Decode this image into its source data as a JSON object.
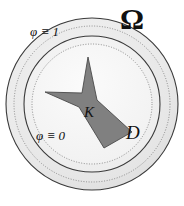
{
  "figure": {
    "canvas": {
      "width": 184,
      "height": 206,
      "background": "#ffffff"
    },
    "geometry": {
      "center_x": 92,
      "center_y": 104,
      "circles": [
        {
          "name": "outer-boundary-omega",
          "radius": 86,
          "style": "solid",
          "stroke": "#3a3a3a",
          "fill": "#ebebeb"
        },
        {
          "name": "outer-dotted-ring",
          "radius": 78,
          "style": "dotted",
          "stroke": "#8a8a8a",
          "fill": "#e6e6e6"
        },
        {
          "name": "middle-solid-ring",
          "radius": 68,
          "style": "solid",
          "stroke": "#3a3a3a",
          "fill": "#efefef"
        },
        {
          "name": "inner-dotted-ring",
          "radius": 60,
          "style": "dotted",
          "stroke": "#8a8a8a",
          "fill": "#f4f4f4"
        }
      ],
      "compact-set-polygon": {
        "name": "K",
        "fill": "#808080",
        "stroke": "#4a4a4a",
        "points": "88,57 97,100 132,132 104,148 79,107 45,92 82,93"
      }
    },
    "labels": {
      "phi_one": "φ ≡ 1",
      "phi_zero": "φ ≡ 0",
      "omega": "Ω",
      "domain_d": "D",
      "compact_k": "K"
    },
    "colors": {
      "ink": "#111111",
      "compact_fill": "#808080",
      "ring_light": "#ebebeb",
      "ring_line": "#3a3a3a",
      "dotted_line": "#8a8a8a"
    }
  }
}
